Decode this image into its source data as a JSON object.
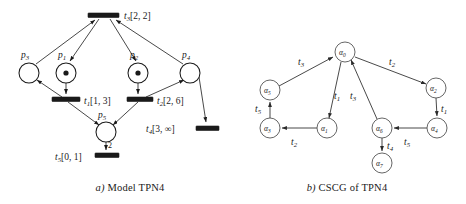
{
  "figure": {
    "panels": [
      {
        "id": "a",
        "caption_prefix": "a)",
        "caption_text": " Model TPN4",
        "type": "timed-petri-net",
        "places": [
          {
            "name": "p3",
            "sub": "3",
            "label": "p",
            "cx": 29,
            "cy": 73,
            "r": 10,
            "tokens": 0,
            "label_x": 25,
            "label_y": 56
          },
          {
            "name": "p1",
            "sub": "1",
            "label": "p",
            "cx": 66,
            "cy": 73,
            "r": 10,
            "tokens": 1,
            "label_x": 62,
            "label_y": 56
          },
          {
            "name": "p2",
            "sub": "2",
            "label": "p",
            "cx": 138,
            "cy": 73,
            "r": 10,
            "tokens": 1,
            "label_x": 134,
            "label_y": 56
          },
          {
            "name": "p4",
            "sub": "4",
            "label": "p",
            "cx": 190,
            "cy": 73,
            "r": 10,
            "tokens": 0,
            "label_x": 186,
            "label_y": 56
          },
          {
            "name": "p5",
            "sub": "5",
            "label": "p",
            "cx": 106,
            "cy": 132,
            "r": 10,
            "tokens": 0,
            "label_x": 102,
            "label_y": 116
          }
        ],
        "transitions": [
          {
            "name": "t3",
            "label": "t",
            "sub": "3",
            "interval": "[2, 2]",
            "x": 88,
            "y": 13,
            "w": 31,
            "h": 4.5,
            "label_x": 124,
            "label_y": 17
          },
          {
            "name": "t1",
            "label": "t",
            "sub": "1",
            "interval": "[1, 3]",
            "x": 52,
            "y": 97,
            "w": 28,
            "h": 4.5,
            "label_x": 84,
            "label_y": 102
          },
          {
            "name": "t2",
            "label": "t",
            "sub": "2",
            "interval": "[2, 6]",
            "x": 127,
            "y": 97,
            "w": 26,
            "h": 4.5,
            "label_x": 157,
            "label_y": 102
          },
          {
            "name": "t4",
            "label": "t",
            "sub": "4",
            "interval": "[3, ∞]",
            "x": 196,
            "y": 126,
            "w": 23,
            "h": 4.5,
            "label_x": 146,
            "label_y": 131
          },
          {
            "name": "t5",
            "label": "t",
            "sub": "5",
            "interval": "[0, 1]",
            "x": 95,
            "y": 153,
            "w": 24,
            "h": 4.5,
            "label_x": 55,
            "label_y": 158
          }
        ],
        "arc_weights": [
          {
            "value": "2",
            "x": 110,
            "y": 148
          }
        ]
      },
      {
        "id": "b",
        "caption_prefix": "b)",
        "caption_text": " CSCG of TPN4",
        "type": "state-class-graph",
        "states": [
          {
            "name": "alpha0",
            "label": "α",
            "sub": "0",
            "cx": 345,
            "cy": 52,
            "r": 10
          },
          {
            "name": "alpha5",
            "label": "α",
            "sub": "5",
            "cx": 270,
            "cy": 90,
            "r": 10
          },
          {
            "name": "alpha2",
            "label": "α",
            "sub": "2",
            "cx": 436,
            "cy": 88,
            "r": 10
          },
          {
            "name": "alpha3",
            "label": "α",
            "sub": "3",
            "cx": 270,
            "cy": 128,
            "r": 10
          },
          {
            "name": "alpha1",
            "label": "α",
            "sub": "1",
            "cx": 327,
            "cy": 128,
            "r": 10
          },
          {
            "name": "alpha6",
            "label": "α",
            "sub": "6",
            "cx": 382,
            "cy": 128,
            "r": 10
          },
          {
            "name": "alpha4",
            "label": "α",
            "sub": "4",
            "cx": 437,
            "cy": 128,
            "r": 10
          },
          {
            "name": "alpha7",
            "label": "α",
            "sub": "7",
            "cx": 382,
            "cy": 163,
            "r": 10
          }
        ],
        "edges": [
          {
            "from": "alpha5",
            "to": "alpha0",
            "label": "t",
            "sub": "3",
            "label_x": 300,
            "label_y": 62
          },
          {
            "from": "alpha0",
            "to": "alpha2",
            "label": "t",
            "sub": "2",
            "label_x": 390,
            "label_y": 62
          },
          {
            "from": "alpha0",
            "to": "alpha1",
            "label": "t",
            "sub": "1",
            "label_x": 335,
            "label_y": 96
          },
          {
            "from": "alpha6",
            "to": "alpha0",
            "label": "t",
            "sub": "3",
            "label_x": 352,
            "label_y": 96
          },
          {
            "from": "alpha3",
            "to": "alpha5",
            "label": "t",
            "sub": "5",
            "label_x": 258,
            "label_y": 110
          },
          {
            "from": "alpha1",
            "to": "alpha3",
            "label": "t",
            "sub": "2",
            "label_x": 294,
            "label_y": 142
          },
          {
            "from": "alpha2",
            "to": "alpha4",
            "label": "t",
            "sub": "1",
            "label_x": 443,
            "label_y": 110
          },
          {
            "from": "alpha4",
            "to": "alpha6",
            "label": "t",
            "sub": "5",
            "label_x": 405,
            "label_y": 142
          },
          {
            "from": "alpha6",
            "to": "alpha7",
            "label": "t",
            "sub": "4",
            "label_x": 388,
            "label_y": 147
          }
        ]
      }
    ]
  }
}
